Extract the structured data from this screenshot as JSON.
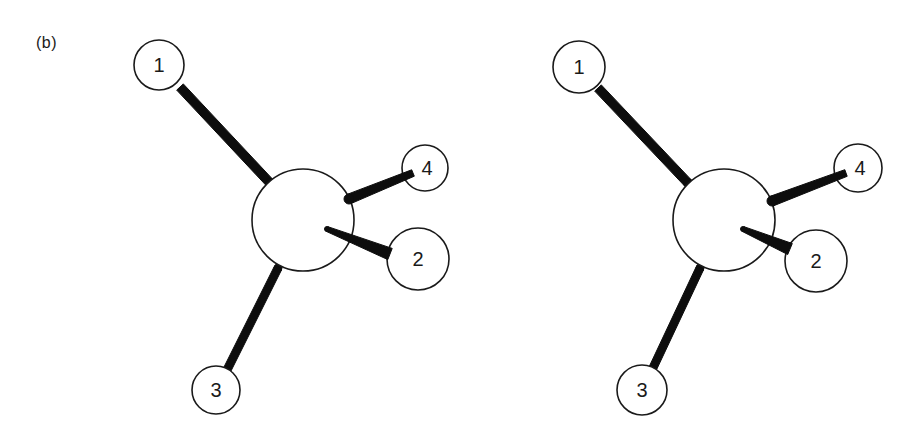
{
  "figure": {
    "panel_label": "(b)",
    "colors": {
      "ink": "#1a1a1a",
      "bond": "#0d0d0d",
      "background": "#ffffff"
    }
  },
  "views": [
    {
      "name": "left-view",
      "central_atom": {
        "cx": 303,
        "cy": 220,
        "r": 51
      },
      "atoms": [
        {
          "label": "1",
          "cx": 159,
          "cy": 65,
          "r": 25
        },
        {
          "label": "2",
          "cx": 418,
          "cy": 259,
          "r": 31
        },
        {
          "label": "3",
          "cx": 216,
          "cy": 390,
          "r": 24
        },
        {
          "label": "4",
          "cx": 425,
          "cy": 168,
          "r": 23
        }
      ],
      "bonds": [
        {
          "to": "1",
          "x1": 270,
          "y1": 183,
          "x2": 180,
          "y2": 87,
          "w1": 9,
          "w2": 9,
          "layer": "behind"
        },
        {
          "to": "3",
          "x1": 278,
          "y1": 268,
          "x2": 227,
          "y2": 370,
          "w1": 8,
          "w2": 8,
          "layer": "behind"
        },
        {
          "to": "4",
          "x1": 349,
          "y1": 199,
          "x2": 413,
          "y2": 173,
          "w1": 10,
          "w2": 7,
          "layer": "front"
        },
        {
          "to": "2",
          "x1": 327,
          "y1": 229,
          "x2": 390,
          "y2": 254,
          "w1": 5,
          "w2": 12,
          "layer": "front"
        }
      ]
    },
    {
      "name": "right-view",
      "central_atom": {
        "cx": 724,
        "cy": 220,
        "r": 51
      },
      "atoms": [
        {
          "label": "1",
          "cx": 579,
          "cy": 67,
          "r": 26
        },
        {
          "label": "2",
          "cx": 816,
          "cy": 261,
          "r": 31
        },
        {
          "label": "3",
          "cx": 642,
          "cy": 390,
          "r": 25
        },
        {
          "label": "4",
          "cx": 858,
          "cy": 168,
          "r": 24
        }
      ],
      "bonds": [
        {
          "to": "1",
          "x1": 688,
          "y1": 183,
          "x2": 598,
          "y2": 88,
          "w1": 9,
          "w2": 9,
          "layer": "behind"
        },
        {
          "to": "3",
          "x1": 700,
          "y1": 268,
          "x2": 652,
          "y2": 370,
          "w1": 8,
          "w2": 8,
          "layer": "behind"
        },
        {
          "to": "4",
          "x1": 772,
          "y1": 201,
          "x2": 846,
          "y2": 173,
          "w1": 10,
          "w2": 7,
          "layer": "front"
        },
        {
          "to": "2",
          "x1": 743,
          "y1": 229,
          "x2": 790,
          "y2": 249,
          "w1": 5,
          "w2": 12,
          "layer": "front"
        }
      ]
    }
  ]
}
